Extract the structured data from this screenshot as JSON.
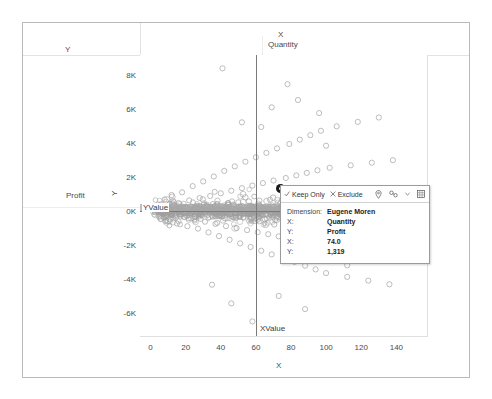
{
  "worksheet": {
    "column_field_shelf": "X",
    "column_field_name": "Quantity",
    "row_field_shelf": "Y",
    "row_field_name": "Profit"
  },
  "chart_data": {
    "type": "scatter",
    "title": "",
    "xlabel": "X",
    "ylabel": "Y",
    "x_tick_labels": [
      "0",
      "20",
      "40",
      "60",
      "80",
      "100",
      "120",
      "140"
    ],
    "x_tick_values": [
      0,
      20,
      40,
      60,
      80,
      100,
      120,
      140
    ],
    "y_tick_labels": [
      "8K",
      "6K",
      "4K",
      "2K",
      "0K",
      "-2K",
      "-4K",
      "-6K"
    ],
    "y_tick_values": [
      8000,
      6000,
      4000,
      2000,
      0,
      -2000,
      -4000,
      -6000
    ],
    "xlim": [
      -6,
      158
    ],
    "ylim": [
      -7400,
      9200
    ],
    "grid": false,
    "legend": "none",
    "marker": "open-circle",
    "marker_color": "#9e9e9e",
    "reference_lines": [
      {
        "name": "YValue",
        "orientation": "horizontal",
        "value": 0,
        "label": "YValue",
        "color": "#7a7a7a"
      },
      {
        "name": "XValue",
        "orientation": "vertical",
        "value": 60,
        "label": "XValue",
        "color": "#7a7a7a"
      }
    ],
    "selected_point": {
      "x": 74.0,
      "y": 1319,
      "dimension": "Eugene Moren",
      "color": "#1a1a1a"
    },
    "points": [
      [
        3,
        140
      ],
      [
        5,
        -260
      ],
      [
        6,
        410
      ],
      [
        7,
        -120
      ],
      [
        8,
        690
      ],
      [
        9,
        -540
      ],
      [
        10,
        230
      ],
      [
        11,
        -80
      ],
      [
        12,
        960
      ],
      [
        13,
        -410
      ],
      [
        14,
        150
      ],
      [
        15,
        -720
      ],
      [
        16,
        480
      ],
      [
        17,
        -190
      ],
      [
        18,
        1120
      ],
      [
        19,
        -330
      ],
      [
        20,
        260
      ],
      [
        21,
        -880
      ],
      [
        22,
        640
      ],
      [
        23,
        -150
      ],
      [
        24,
        1480
      ],
      [
        25,
        -470
      ],
      [
        26,
        310
      ],
      [
        27,
        -1020
      ],
      [
        28,
        780
      ],
      [
        29,
        -220
      ],
      [
        30,
        1760
      ],
      [
        31,
        -610
      ],
      [
        32,
        390
      ],
      [
        33,
        -1240
      ],
      [
        34,
        900
      ],
      [
        35,
        -260
      ],
      [
        36,
        2050
      ],
      [
        37,
        -740
      ],
      [
        38,
        430
      ],
      [
        39,
        -1460
      ],
      [
        40,
        1060
      ],
      [
        41,
        -300
      ],
      [
        42,
        2380
      ],
      [
        43,
        -870
      ],
      [
        44,
        480
      ],
      [
        45,
        -1680
      ],
      [
        46,
        1210
      ],
      [
        47,
        -340
      ],
      [
        48,
        2640
      ],
      [
        49,
        -990
      ],
      [
        50,
        530
      ],
      [
        51,
        -1890
      ],
      [
        52,
        1360
      ],
      [
        53,
        -380
      ],
      [
        54,
        2920
      ],
      [
        55,
        -1110
      ],
      [
        56,
        580
      ],
      [
        57,
        -2100
      ],
      [
        58,
        1510
      ],
      [
        59,
        -420
      ],
      [
        60,
        3180
      ],
      [
        61,
        -1230
      ],
      [
        62,
        630
      ],
      [
        63,
        -2320
      ],
      [
        64,
        1660
      ],
      [
        65,
        -460
      ],
      [
        66,
        3440
      ],
      [
        67,
        -1350
      ],
      [
        68,
        680
      ],
      [
        69,
        -2540
      ],
      [
        70,
        1810
      ],
      [
        71,
        -500
      ],
      [
        72,
        3700
      ],
      [
        73,
        -1470
      ],
      [
        74,
        1319
      ],
      [
        75,
        730
      ],
      [
        76,
        -2760
      ],
      [
        77,
        1960
      ],
      [
        78,
        -540
      ],
      [
        79,
        3960
      ],
      [
        80,
        -1590
      ],
      [
        81,
        780
      ],
      [
        82,
        -2980
      ],
      [
        83,
        2110
      ],
      [
        84,
        -580
      ],
      [
        85,
        4220
      ],
      [
        86,
        -1710
      ],
      [
        87,
        830
      ],
      [
        88,
        -3200
      ],
      [
        89,
        2260
      ],
      [
        90,
        -620
      ],
      [
        91,
        4480
      ],
      [
        92,
        -1830
      ],
      [
        93,
        880
      ],
      [
        94,
        -3420
      ],
      [
        95,
        2410
      ],
      [
        96,
        -660
      ],
      [
        97,
        4740
      ],
      [
        98,
        -1950
      ],
      [
        99,
        930
      ],
      [
        100,
        -3640
      ],
      [
        102,
        2560
      ],
      [
        104,
        -700
      ],
      [
        106,
        5000
      ],
      [
        108,
        -2070
      ],
      [
        110,
        980
      ],
      [
        112,
        -3860
      ],
      [
        114,
        2710
      ],
      [
        116,
        -740
      ],
      [
        118,
        5260
      ],
      [
        120,
        -2190
      ],
      [
        122,
        1030
      ],
      [
        124,
        -4080
      ],
      [
        126,
        2860
      ],
      [
        128,
        -780
      ],
      [
        130,
        5520
      ],
      [
        132,
        -2310
      ],
      [
        134,
        1080
      ],
      [
        136,
        -4300
      ],
      [
        138,
        3010
      ],
      [
        140,
        -820
      ],
      [
        41,
        8420
      ],
      [
        78,
        7480
      ],
      [
        69,
        6120
      ],
      [
        96,
        5780
      ],
      [
        63,
        4960
      ],
      [
        84,
        6550
      ],
      [
        52,
        5240
      ],
      [
        100,
        3860
      ],
      [
        46,
        -5420
      ],
      [
        58,
        -6480
      ],
      [
        73,
        -4980
      ],
      [
        88,
        -5760
      ],
      [
        35,
        -4320
      ],
      [
        67,
        -6950
      ],
      [
        112,
        -3180
      ]
    ],
    "dense_cluster_note": "several hundred overlapping open circles piled along Y=0 between X=0 and X=100"
  },
  "tooltip": {
    "actions": [
      {
        "icon": "check-icon",
        "label": "Keep Only"
      },
      {
        "icon": "x-icon",
        "label": "Exclude"
      }
    ],
    "tools": [
      {
        "icon": "pin-icon",
        "label": ""
      },
      {
        "icon": "group-icon",
        "label": ""
      },
      {
        "icon": "chevron-down-icon",
        "label": ""
      },
      {
        "icon": "view-data-icon",
        "label": ""
      }
    ],
    "rows": [
      {
        "key": "Dimension:",
        "value": "Eugene Moren"
      },
      {
        "key": "X:",
        "value": "Quantity"
      },
      {
        "key": "Y:",
        "value": "Profit"
      },
      {
        "key": "X:",
        "value": "74.0"
      },
      {
        "key": "Y:",
        "value": "1,319"
      }
    ]
  }
}
